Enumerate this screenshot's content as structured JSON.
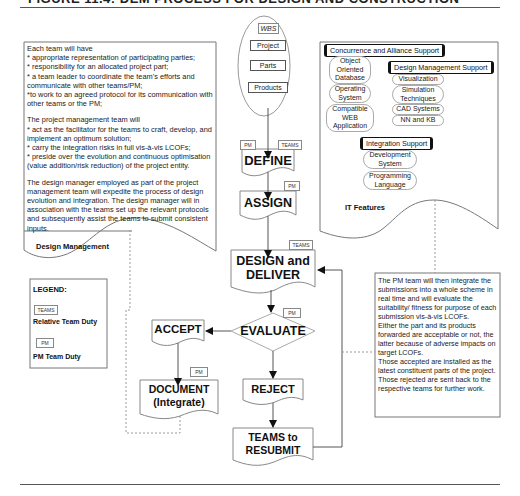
{
  "header": {
    "title": "FIGURE 11.4: DEM PROCESS FOR DESIGN AND CONSTRUCTION"
  },
  "design_management": {
    "label": "Design Management",
    "team_intro": "Each team will have",
    "team_points": [
      "* appropriate representation of participating parties;",
      "* responsibility for an allocated project part;",
      "* a team leader to coordinate the team's efforts and communicate with other teams/PM;",
      "*to work to an agreed protocol for its communication with other teams or the PM;"
    ],
    "pm_intro": "The project management team will",
    "pm_points": [
      "* act as the facilitator for the teams to craft, develop, and implement an optimum solution;",
      "*  carry the integration risks in full vis-à-vis LCOFs;",
      "* preside over the evolution and continuous optimisation (value addition/risk reduction) of the project entity."
    ],
    "design_manager": "The design manager employed as part of the project management team will expedite the process of design evolution and integration. The design manager will in association with the teams set up the relevant protocols and subsequently assist the teams to submit consistent inputs."
  },
  "legend": {
    "title": "LEGEND:",
    "teams_tag": "TEAMS",
    "teams_label": "Relative Team  Duty",
    "pm_tag": "PM",
    "pm_label": "PM Team Duty"
  },
  "wbs": {
    "title": "WBS",
    "items": [
      "Project",
      "Parts",
      "Products"
    ]
  },
  "flow": {
    "define": {
      "label": "DEFINE",
      "tags": [
        "PM",
        "TEAMS"
      ]
    },
    "assign": {
      "label": "ASSIGN",
      "tag": "PM"
    },
    "design_deliver": {
      "line1": "DESIGN and",
      "line2": "DELIVER",
      "tag": "TEAMS"
    },
    "evaluate": {
      "label": "EVALUATE",
      "tag": "PM"
    },
    "accept": {
      "label": "ACCEPT"
    },
    "document": {
      "line1": "DOCUMENT",
      "line2": "(Integrate)",
      "tag": "PM"
    },
    "reject": {
      "label": "REJECT"
    },
    "resubmit": {
      "line1": "TEAMS to",
      "line2": "RESUBMIT"
    }
  },
  "it_features": {
    "label": "IT Features",
    "concurrence": {
      "title": "Concurrence and Alliance Support",
      "items": [
        "Object Oriented Database",
        "Operating System",
        "Compatible WEB Application"
      ]
    },
    "design_support": {
      "title": "Design Management Support",
      "items": [
        "Visualization",
        "Simulation Techniques",
        "CAD Systems",
        "NN and KB"
      ]
    },
    "integration": {
      "title": "Integration Support",
      "items": [
        "Development System",
        "Programming Language"
      ]
    }
  },
  "pm_note": {
    "paragraphs": [
      "The PM team will then integrate the submissions into a whole scheme in real time and will evaluate the suitability/ fitness for purpose of each submission vis-à-vis LCOFs.",
      "Either the part and its products forwarded are acceptable or not, the latter because of adverse impacts on target LCOFs.",
      "Those accepted are installed as the latest constituent parts of the project.",
      "Those rejected are sent back to the respective teams for further work."
    ]
  }
}
